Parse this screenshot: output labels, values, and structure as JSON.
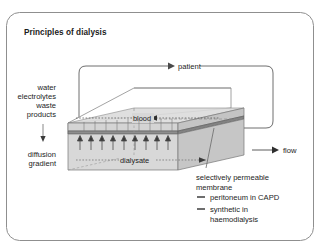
{
  "figure": {
    "title": "Principles of dialysis",
    "frame": {
      "border_color": "#8a8a8a",
      "background": "#ffffff"
    }
  },
  "labels": {
    "patient": "patient",
    "blood": "blood",
    "dialysate": "dialysate",
    "flow": "flow"
  },
  "left_annotation": {
    "lines": [
      "water",
      "electrolytes",
      "waste",
      "products"
    ],
    "gradient_lines": [
      "diffusion",
      "gradient"
    ],
    "arrow_icon": "down-arrow-icon"
  },
  "legend": {
    "caption_lines": [
      "selectively permeable",
      "membrane"
    ],
    "items": [
      {
        "marker": "dash-marker",
        "label": "peritoneum in CAPD"
      },
      {
        "marker": "dash-marker",
        "label_line1": "synthetic in",
        "label_line2": "haemodialysis"
      }
    ]
  },
  "colors": {
    "outline": "#6e6e6e",
    "box_top": "#f4f4f4",
    "box_front": "#d9d9d9",
    "box_side": "#c9c9c9",
    "membrane": "#9a9a9a",
    "blood_band": "#cfcfcf",
    "text": "#1c1c1c"
  },
  "diffusion_arrows": {
    "count": 10,
    "direction": "up"
  }
}
